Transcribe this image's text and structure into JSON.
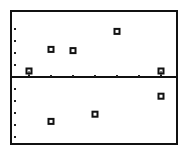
{
  "chart_data": {
    "type": "scatter",
    "title": "",
    "xlabel": "",
    "ylabel": "",
    "grid": false,
    "legend": null,
    "axis_style": "graphing-calculator residual-style plot; x-axis at y=0 with tick dots; y tick dots along left edge",
    "xlim": [
      0,
      7.5
    ],
    "ylim": [
      -5.6,
      5.5
    ],
    "x_ticks": [
      1,
      2,
      3,
      4,
      5,
      6,
      7
    ],
    "y_ticks": [
      -5,
      -4,
      -3,
      -2,
      -1,
      1,
      2,
      3,
      4
    ],
    "series": [
      {
        "name": "points",
        "marker": "hollow-square",
        "points": [
          {
            "x": 1,
            "y": 0.5
          },
          {
            "x": 2,
            "y": 2.3
          },
          {
            "x": 3,
            "y": 2.2
          },
          {
            "x": 5,
            "y": 3.8
          },
          {
            "x": 7,
            "y": 0.5
          },
          {
            "x": 2,
            "y": -3.7
          },
          {
            "x": 4,
            "y": -3.1
          },
          {
            "x": 7,
            "y": -1.6
          }
        ]
      }
    ]
  },
  "layout": {
    "frame": {
      "left": 11,
      "top": 11,
      "right": 177,
      "bottom": 144
    },
    "origin_px": {
      "x": 7,
      "y": 77
    },
    "px_per_x": 22,
    "px_per_y": 12,
    "y_tick_x": 15,
    "colors": {
      "ink": "#111111",
      "background": "#ffffff"
    }
  }
}
